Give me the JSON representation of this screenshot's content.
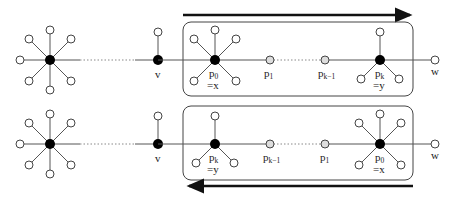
{
  "diagram": {
    "rows": [
      {
        "id": "top",
        "arrow_direction": "right",
        "labels": {
          "v": "v",
          "n1": {
            "main": "p",
            "sub": "0"
          },
          "n1_eq": "=x",
          "n2": {
            "main": "p",
            "sub": "1"
          },
          "n3": {
            "main": "p",
            "sub": "k−1"
          },
          "n4": {
            "main": "p",
            "sub": "k"
          },
          "n4_eq": "=y",
          "w": "w"
        }
      },
      {
        "id": "bottom",
        "arrow_direction": "left",
        "labels": {
          "v": "v",
          "n1": {
            "main": "p",
            "sub": "k"
          },
          "n1_eq": "=y",
          "n2": {
            "main": "p",
            "sub": "k−1"
          },
          "n3": {
            "main": "p",
            "sub": "1"
          },
          "n4": {
            "main": "p",
            "sub": "0"
          },
          "n4_eq": "=x",
          "w": "w"
        }
      }
    ],
    "colors": {
      "edge": "#555555",
      "filled_node": "#000000",
      "open_node_stroke": "#444444",
      "path_node_fill": "#dddddd",
      "box_stroke": "#444444",
      "arrow": "#111111"
    }
  }
}
